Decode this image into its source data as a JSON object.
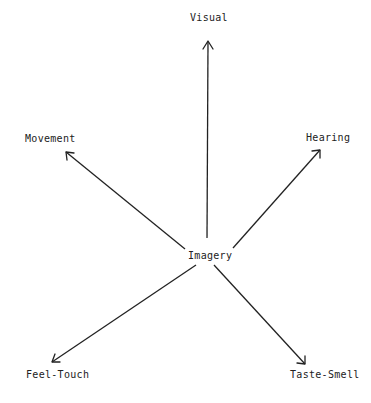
{
  "diagram": {
    "center": {
      "label": "Imagery"
    },
    "branches": [
      {
        "label": "Visual",
        "direction": "up"
      },
      {
        "label": "Movement",
        "direction": "upper-left"
      },
      {
        "label": "Hearing",
        "direction": "upper-right"
      },
      {
        "label": "Feel-Touch",
        "direction": "lower-left"
      },
      {
        "label": "Taste-Smell",
        "direction": "lower-right"
      }
    ],
    "colors": {
      "ink": "#222222",
      "background": "#ffffff"
    }
  }
}
